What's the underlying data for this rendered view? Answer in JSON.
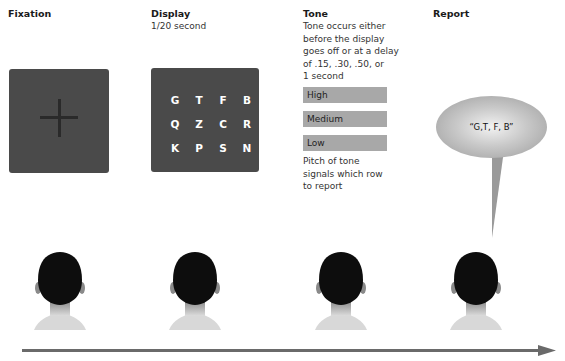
{
  "stages": [
    {
      "id": "fixation",
      "title": "Fixation",
      "subtitle": ""
    },
    {
      "id": "display",
      "title": "Display",
      "subtitle": "1/20 second"
    },
    {
      "id": "tone",
      "title": "Tone",
      "subtitle": "Tone occurs either before the display goes off or at a delay of .15, .30, .50, or 1 second"
    },
    {
      "id": "report",
      "title": "Report",
      "subtitle": ""
    }
  ],
  "tone": {
    "lines": [
      "Tone occurs either",
      "before the display",
      "goes off or at a delay",
      "of .15, .30, .50, or",
      "1 second"
    ],
    "levels": [
      "High",
      "Medium",
      "Low"
    ],
    "footer_lines": [
      "Pitch of tone",
      "signals which row",
      "to report"
    ]
  },
  "display_letters": [
    "G",
    "T",
    "F",
    "B",
    "Q",
    "Z",
    "C",
    "R",
    "K",
    "P",
    "S",
    "N"
  ],
  "fixation_symbol": "+",
  "report_bubble": "“G,T, F, B”",
  "timeline": {
    "direction": "left-to-right arrow"
  }
}
